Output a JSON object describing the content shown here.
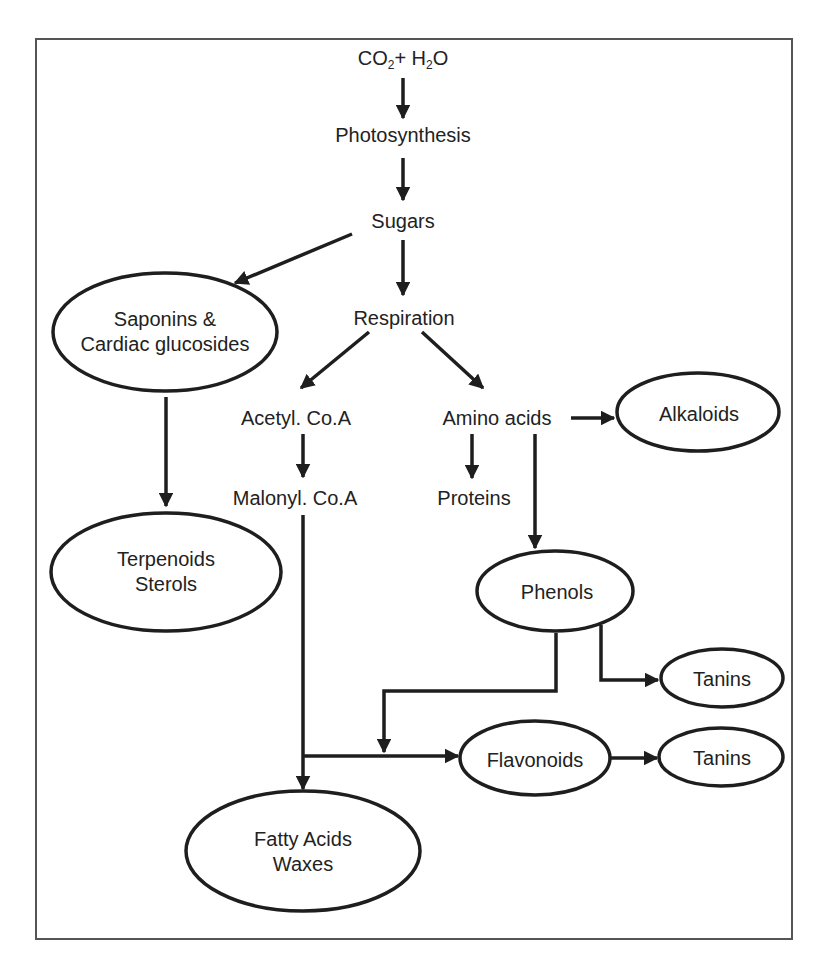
{
  "diagram": {
    "frame": {
      "x": 36,
      "y": 39,
      "width": 756,
      "height": 900,
      "stroke": "#555555"
    },
    "colors": {
      "stroke": "#1e1e1e",
      "text": "#222222",
      "background": "#ffffff"
    },
    "nodes": {
      "co2_h2o": {
        "parts": [
          "CO",
          "2",
          "+ H",
          "2",
          "O"
        ],
        "shape": "text"
      },
      "photosynthesis": {
        "label": "Photosynthesis",
        "shape": "text"
      },
      "sugars": {
        "label": "Sugars",
        "shape": "text"
      },
      "respiration": {
        "label": "Respiration",
        "shape": "text"
      },
      "saponins": {
        "line1": "Saponins &",
        "line2": "Cardiac glucosides",
        "shape": "ellipse"
      },
      "acetyl_coa": {
        "label": "Acetyl. Co.A",
        "shape": "text"
      },
      "amino_acids": {
        "label": "Amino acids",
        "shape": "text"
      },
      "alkaloids": {
        "label": "Alkaloids",
        "shape": "ellipse"
      },
      "malonyl_coa": {
        "label": "Malonyl. Co.A",
        "shape": "text"
      },
      "proteins": {
        "label": "Proteins",
        "shape": "text"
      },
      "terpenoids": {
        "line1": "Terpenoids",
        "line2": "Sterols",
        "shape": "ellipse"
      },
      "phenols": {
        "label": "Phenols",
        "shape": "ellipse"
      },
      "tanins_1": {
        "label": "Tanins",
        "shape": "ellipse"
      },
      "flavonoids": {
        "label": "Flavonoids",
        "shape": "ellipse"
      },
      "tanins_2": {
        "label": "Tanins",
        "shape": "ellipse"
      },
      "fatty_acids": {
        "line1": "Fatty Acids",
        "line2": "Waxes",
        "shape": "ellipse"
      }
    },
    "edges": [
      {
        "from": "CO2 + H2O",
        "to": "Photosynthesis"
      },
      {
        "from": "Photosynthesis",
        "to": "Sugars"
      },
      {
        "from": "Sugars",
        "to": "Respiration"
      },
      {
        "from": "Sugars",
        "to": "Saponins & Cardiac glucosides"
      },
      {
        "from": "Respiration",
        "to": "Acetyl. Co.A"
      },
      {
        "from": "Respiration",
        "to": "Amino acids"
      },
      {
        "from": "Saponins & Cardiac glucosides",
        "to": "Terpenoids Sterols"
      },
      {
        "from": "Acetyl. Co.A",
        "to": "Malonyl. Co.A"
      },
      {
        "from": "Amino acids",
        "to": "Alkaloids"
      },
      {
        "from": "Amino acids",
        "to": "Proteins"
      },
      {
        "from": "Amino acids",
        "to": "Phenols"
      },
      {
        "from": "Malonyl. Co.A",
        "to": "Fatty Acids Waxes"
      },
      {
        "from": "Malonyl. Co.A",
        "to": "Flavonoids"
      },
      {
        "from": "Phenols",
        "to": "Flavonoids"
      },
      {
        "from": "Phenols",
        "to": "Tanins"
      },
      {
        "from": "Flavonoids",
        "to": "Tanins"
      }
    ]
  }
}
